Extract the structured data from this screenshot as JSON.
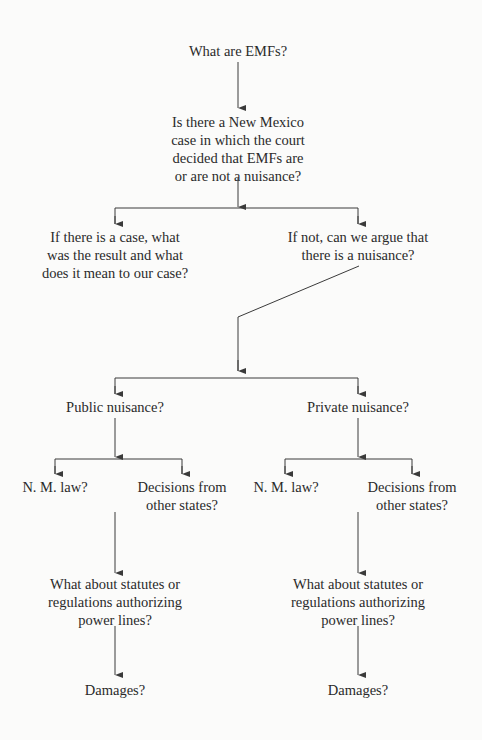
{
  "diagram": {
    "type": "flowchart",
    "nodes": {
      "emfs": {
        "lines": [
          "What are EMFs?"
        ]
      },
      "nm_case": {
        "lines": [
          "Is there a New Mexico",
          "case in which the court",
          "decided that EMFs are",
          "or are not a nuisance?"
        ]
      },
      "if_case": {
        "lines": [
          "If there is a case, what",
          "was the result and what",
          "does it mean to our case?"
        ]
      },
      "if_not": {
        "lines": [
          "If not, can we argue that",
          "there is a nuisance?"
        ]
      },
      "public": {
        "lines": [
          "Public nuisance?"
        ]
      },
      "private": {
        "lines": [
          "Private nuisance?"
        ]
      },
      "pub_nm_law": {
        "lines": [
          "N. M. law?"
        ]
      },
      "pub_decisions": {
        "lines": [
          "Decisions from",
          "other states?"
        ]
      },
      "priv_nm_law": {
        "lines": [
          "N. M. law?"
        ]
      },
      "priv_decisions": {
        "lines": [
          "Decisions from",
          "other states?"
        ]
      },
      "pub_statutes": {
        "lines": [
          "What about statutes or",
          "regulations authorizing",
          "power lines?"
        ]
      },
      "priv_statutes": {
        "lines": [
          "What about statutes or",
          "regulations authorizing",
          "power lines?"
        ]
      },
      "pub_damages": {
        "lines": [
          "Damages?"
        ]
      },
      "priv_damages": {
        "lines": [
          "Damages?"
        ]
      }
    },
    "edges": [
      [
        "emfs",
        "nm_case"
      ],
      [
        "nm_case",
        "if_case"
      ],
      [
        "nm_case",
        "if_not"
      ],
      [
        "if_not",
        "public"
      ],
      [
        "if_not",
        "private"
      ],
      [
        "public",
        "pub_nm_law"
      ],
      [
        "public",
        "pub_decisions"
      ],
      [
        "private",
        "priv_nm_law"
      ],
      [
        "private",
        "priv_decisions"
      ],
      [
        "public",
        "pub_statutes"
      ],
      [
        "private",
        "priv_statutes"
      ],
      [
        "pub_statutes",
        "pub_damages"
      ],
      [
        "priv_statutes",
        "priv_damages"
      ]
    ],
    "line_color": "#3a3a3a"
  }
}
